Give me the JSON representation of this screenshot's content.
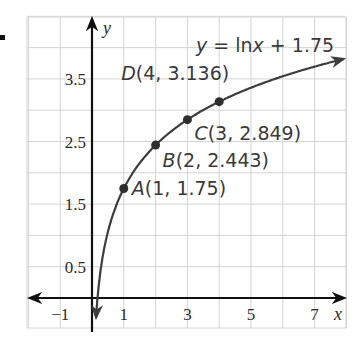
{
  "problem_marker": ".",
  "chart_data": {
    "type": "line",
    "title": "",
    "equation": "y = ln x + 1.75",
    "xlabel": "x",
    "ylabel": "y",
    "xlim": [
      -2,
      8
    ],
    "ylim": [
      -1,
      4
    ],
    "grid": true,
    "x_ticks": [
      "−1",
      "1",
      "3",
      "5",
      "7"
    ],
    "x_tick_values": [
      -1,
      1,
      3,
      5,
      7
    ],
    "y_ticks": [
      "0.5",
      "1.5",
      "2.5",
      "3.5"
    ],
    "y_tick_values": [
      0.5,
      1.5,
      2.5,
      3.5
    ],
    "series": [
      {
        "name": "y = ln x + 1.75",
        "function": "ln(x) + 1.75",
        "domain": [
          0.12,
          8
        ]
      }
    ],
    "points": [
      {
        "label": "A",
        "x": 1,
        "y": 1.75,
        "text": "A(1, 1.75)"
      },
      {
        "label": "B",
        "x": 2,
        "y": 2.443,
        "text": "B(2, 2.443)"
      },
      {
        "label": "C",
        "x": 3,
        "y": 2.849,
        "text": "C(3, 2.849)"
      },
      {
        "label": "D",
        "x": 4,
        "y": 3.136,
        "text": "D(4, 3.136)"
      }
    ]
  },
  "colors": {
    "grid": "#d4d4d4",
    "axis": "#111111",
    "curve": "#3c3c3c",
    "point": "#2e2e2e",
    "text": "#3a3a3a"
  }
}
